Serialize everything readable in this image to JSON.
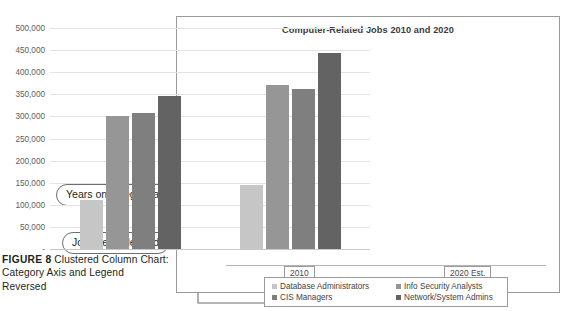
{
  "figure": {
    "label": "FIGURE 8",
    "caption": "Clustered Column Chart: Category Axis and Legend Reversed"
  },
  "callouts": [
    {
      "id": "years-on-category-axis",
      "text": "Years on category axis"
    },
    {
      "id": "job-titles-in-legend",
      "text": "Job titles in legend"
    }
  ],
  "chart_data": {
    "type": "bar",
    "title": "Computer-Related Jobs 2010 and 2020",
    "xlabel": "",
    "ylabel": "",
    "categories": [
      "2010",
      "2020 Est."
    ],
    "series": [
      {
        "name": "Database Administrators",
        "color": "#c6c6c6",
        "values": [
          110000,
          145000
        ]
      },
      {
        "name": "Info Security Analysts",
        "color": "#969696",
        "values": [
          302000,
          370000
        ]
      },
      {
        "name": "CIS Managers",
        "color": "#7f7f7f",
        "values": [
          307000,
          362000
        ]
      },
      {
        "name": "Network/System Admins",
        "color": "#636363",
        "values": [
          347000,
          443000
        ]
      }
    ],
    "ylim": [
      0,
      500000
    ],
    "ytick_step": 50000,
    "yticks": [
      "500,000",
      "450,000",
      "400,000",
      "350,000",
      "300,000",
      "250,000",
      "200,000",
      "150,000",
      "100,000",
      "50,000",
      "-"
    ],
    "grid": true,
    "legend_position": "bottom"
  },
  "colors": {
    "frame_border": "#9a9a9a",
    "gridline": "#e3e3e3",
    "callout_border": "#6d6e71",
    "text": "#231f20"
  }
}
